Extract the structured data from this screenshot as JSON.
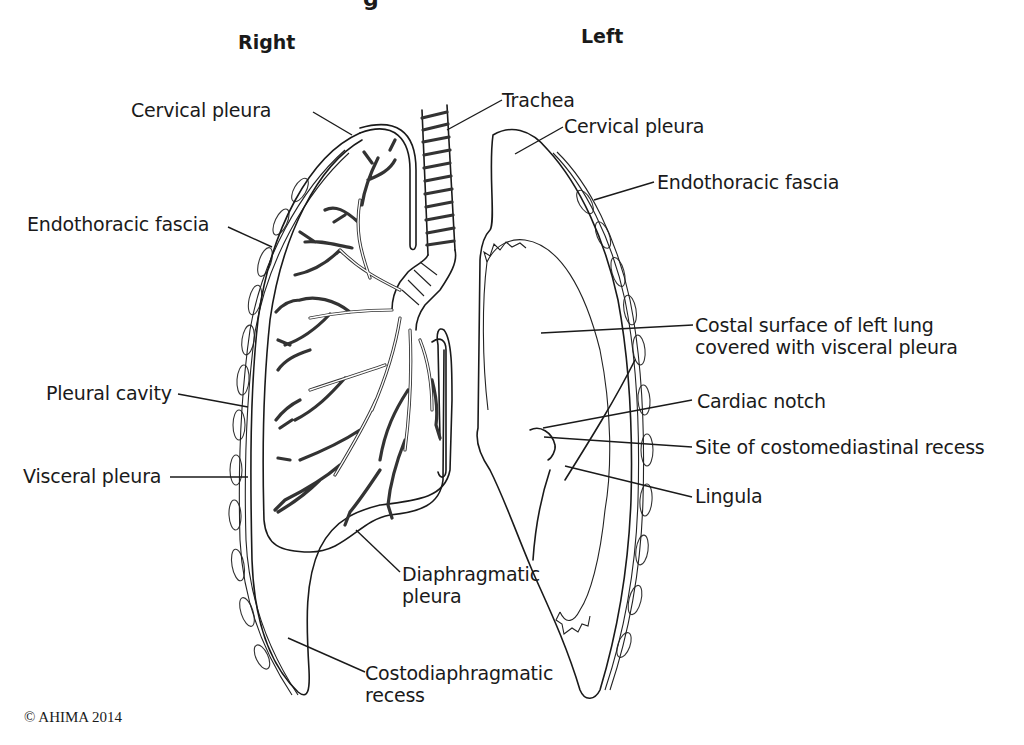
{
  "figure": {
    "title_fragment": "g",
    "side_titles": {
      "right": "Right",
      "left": "Left"
    },
    "copyright": "© AHIMA 2014",
    "labels": {
      "cervical_pleura_right": "Cervical pleura",
      "trachea": "Trachea",
      "cervical_pleura_left": "Cervical pleura",
      "endothoracic_fascia_left": "Endothoracic fascia",
      "endothoracic_fascia_right": "Endothoracic fascia",
      "costal_surface_line1": "Costal surface of left lung",
      "costal_surface_line2": "covered with visceral pleura",
      "cardiac_notch": "Cardiac notch",
      "costomediastinal_recess": "Site of costomediastinal recess",
      "lingula": "Lingula",
      "pleural_cavity": "Pleural cavity",
      "visceral_pleura": "Visceral pleura",
      "diaphragmatic_pleura_line1": "Diaphragmatic",
      "diaphragmatic_pleura_line2": "pleura",
      "costodiaphragmatic_line1": "Costodiaphragmatic",
      "costodiaphragmatic_line2": "recess"
    }
  }
}
